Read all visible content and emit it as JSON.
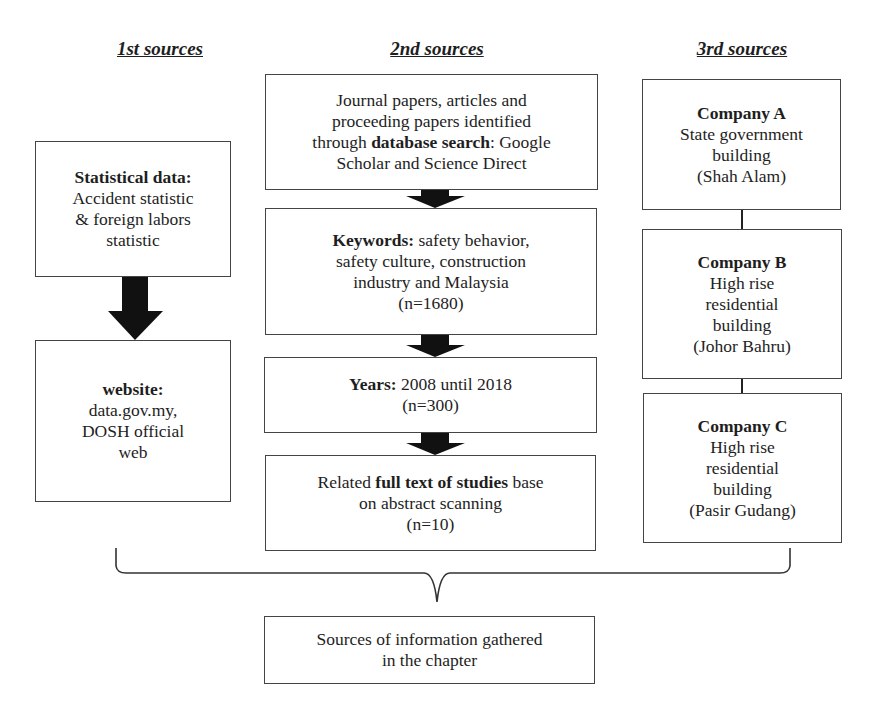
{
  "headers": {
    "first": "1st sources",
    "second": "2nd sources",
    "third": "3rd sources"
  },
  "first_sources": {
    "statistical": {
      "bold": "Statistical data:",
      "line1": "Accident statistic",
      "line2": "& foreign labors",
      "line3": "statistic"
    },
    "website": {
      "bold": "website:",
      "line1": "data.gov.my,",
      "line2": "DOSH official",
      "line3": "web"
    }
  },
  "second_sources": {
    "search": {
      "line1": "Journal papers, articles and",
      "line2": "proceeding papers identified",
      "line3_pre": "through ",
      "line3_bold": "database search",
      "line3_post": ": Google",
      "line4": "Scholar and Science Direct"
    },
    "keywords": {
      "bold": "Keywords:",
      "line1_rest": " safety behavior,",
      "line2": "safety culture, construction",
      "line3": "industry and Malaysia",
      "count": "(n=1680)"
    },
    "years": {
      "bold": "Years:",
      "line1_rest": " 2008 until 2018",
      "count": "(n=300)"
    },
    "fulltext": {
      "pre": "Related ",
      "bold": "full text of studies",
      "post": " base",
      "line2": "on abstract scanning",
      "count": "(n=10)"
    }
  },
  "third_sources": {
    "company_a": {
      "bold": "Company A",
      "line1": "State government",
      "line2": "building",
      "line3": "(Shah Alam)"
    },
    "company_b": {
      "bold": "Company B",
      "line1": "High rise",
      "line2": "residential",
      "line3": "building",
      "line4": "(Johor Bahru)"
    },
    "company_c": {
      "bold": "Company C",
      "line1": "High rise",
      "line2": "residential",
      "line3": "building",
      "line4": "(Pasir Gudang)"
    }
  },
  "result": {
    "line1": "Sources of information gathered",
    "line2": "in the chapter"
  },
  "colors": {
    "border": "#444444",
    "arrow": "#111111",
    "text": "#1e1e1e"
  }
}
